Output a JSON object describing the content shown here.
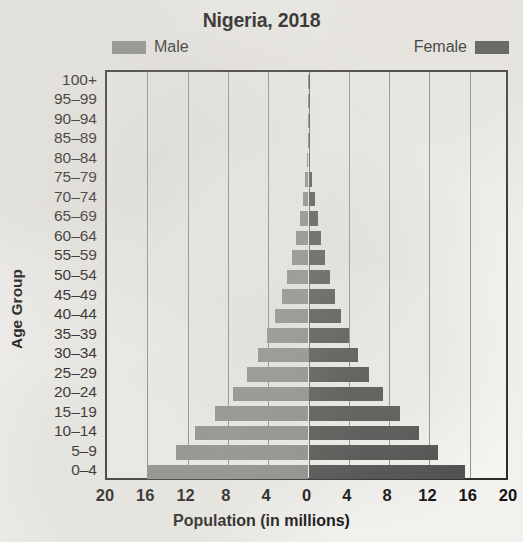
{
  "chart_data": {
    "type": "bar",
    "subtype": "population-pyramid",
    "title": "Nigeria, 2018",
    "xlabel": "Population (in millions)",
    "ylabel": "Age Group",
    "xlim": [
      -20,
      20
    ],
    "xticks": [
      "20",
      "16",
      "12",
      "8",
      "4",
      "0",
      "4",
      "8",
      "12",
      "16",
      "20"
    ],
    "xtick_values": [
      -20,
      -16,
      -12,
      -8,
      -4,
      0,
      4,
      8,
      12,
      16,
      20
    ],
    "xtick_step": 4,
    "grid": true,
    "legend_position": "top",
    "categories": [
      "100+",
      "95–99",
      "90–94",
      "85–89",
      "80–84",
      "75–79",
      "70–74",
      "65–69",
      "60–64",
      "55–59",
      "50–54",
      "45–49",
      "40–44",
      "35–39",
      "30–34",
      "25–29",
      "20–24",
      "15–19",
      "10–14",
      "5–9",
      "0–4"
    ],
    "series": [
      {
        "name": "Male",
        "color": "#8d8d8d",
        "side": "left",
        "values": [
          0.01,
          0.02,
          0.05,
          0.09,
          0.15,
          0.3,
          0.55,
          0.85,
          1.2,
          1.6,
          2.1,
          2.6,
          3.3,
          4.1,
          5.0,
          6.1,
          7.5,
          9.3,
          11.3,
          13.2,
          16.0
        ]
      },
      {
        "name": "Female",
        "color": "#4d4d4d",
        "side": "right",
        "values": [
          0.01,
          0.03,
          0.06,
          0.11,
          0.18,
          0.35,
          0.6,
          0.9,
          1.2,
          1.6,
          2.1,
          2.6,
          3.2,
          4.0,
          4.9,
          6.0,
          7.4,
          9.1,
          11.0,
          12.9,
          15.5
        ]
      }
    ]
  },
  "legend": {
    "male_label": "Male",
    "female_label": "Female",
    "male_color": "#8d8d8d",
    "female_color": "#4d4d4d"
  }
}
